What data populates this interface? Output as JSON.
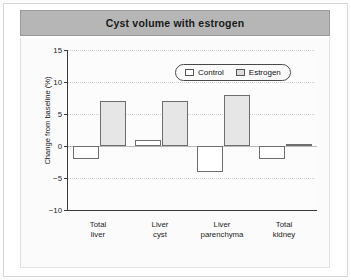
{
  "header": {
    "title": "Cyst volume with estrogen"
  },
  "legend": {
    "position": "top-right-inside",
    "items": [
      {
        "label": "Control",
        "color": "#ffffff"
      },
      {
        "label": "Estrogen",
        "color": "#dcdcdc"
      }
    ]
  },
  "axes": {
    "ylabel": "Change from baseline (%)",
    "yticks": [
      "15",
      "10",
      "5",
      "0",
      "-5",
      "-10"
    ],
    "ymin": -10,
    "ymax": 15
  },
  "chart_data": {
    "type": "bar",
    "title": "Cyst volume with estrogen",
    "xlabel": "",
    "ylabel": "Change from baseline (%)",
    "ylim": [
      -10,
      15
    ],
    "yticks": [
      -10,
      -5,
      0,
      5,
      10,
      15
    ],
    "grid": true,
    "legend_position": "upper right",
    "categories": [
      "Total liver",
      "Liver cyst",
      "Liver parenchyma",
      "Total kidney"
    ],
    "category_lines": [
      [
        "Total",
        "liver"
      ],
      [
        "Liver",
        "cyst"
      ],
      [
        "Liver",
        "parenchyma"
      ],
      [
        "Total",
        "kidney"
      ]
    ],
    "series": [
      {
        "name": "Control",
        "color": "#ffffff",
        "values": [
          -2.0,
          1.0,
          -4.0,
          -2.0
        ]
      },
      {
        "name": "Estrogen",
        "color": "#e6e6e6",
        "values": [
          7.0,
          7.0,
          8.0,
          0.3
        ]
      }
    ]
  }
}
